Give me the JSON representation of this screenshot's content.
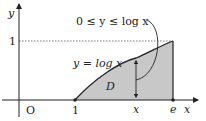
{
  "diagram": {
    "axis_labels": {
      "x": "x",
      "y": "y"
    },
    "origin_label": "O",
    "tick_labels": {
      "x_one": "1",
      "x_x": "x",
      "x_e": "e",
      "y_one": "1"
    },
    "curve_label": "y = log x",
    "region_label": "D",
    "inequality_label": "0 ≤ y ≤ log x",
    "colors": {
      "fill": "#c8c8c8",
      "line": "#222222",
      "dashed": "#555555"
    }
  }
}
